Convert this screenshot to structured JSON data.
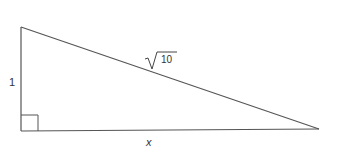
{
  "diagram": {
    "type": "right-triangle",
    "labels": {
      "vertical_leg": "1",
      "hypotenuse_radicand": "10",
      "horizontal_leg": "x"
    },
    "right_angle_marker": true,
    "colors": {
      "stroke": "#555555",
      "text": "#333333",
      "background": "#ffffff"
    }
  }
}
